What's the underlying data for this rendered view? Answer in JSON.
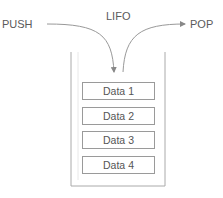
{
  "title": "LIFO",
  "push_label": "PUSH",
  "pop_label": "POP",
  "stack_items": [
    "Data 1",
    "Data 2",
    "Data 3",
    "Data 4"
  ],
  "colors": {
    "line": "#9a9a9a",
    "text": "#5a5a5a"
  }
}
